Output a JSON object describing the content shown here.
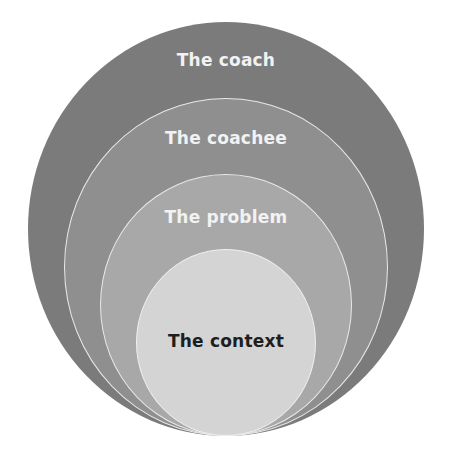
{
  "diagram": {
    "type": "nested-circles",
    "layers": [
      {
        "label": "The coach",
        "fill": "#7b7b7b",
        "text_color": "#f2f2f2"
      },
      {
        "label": "The coachee",
        "fill": "#8f8f8f",
        "text_color": "#f2f2f2"
      },
      {
        "label": "The problem",
        "fill": "#a8a8a8",
        "text_color": "#f2f2f2"
      },
      {
        "label": "The context",
        "fill": "#d4d4d4",
        "text_color": "#1e1e1e"
      }
    ]
  }
}
